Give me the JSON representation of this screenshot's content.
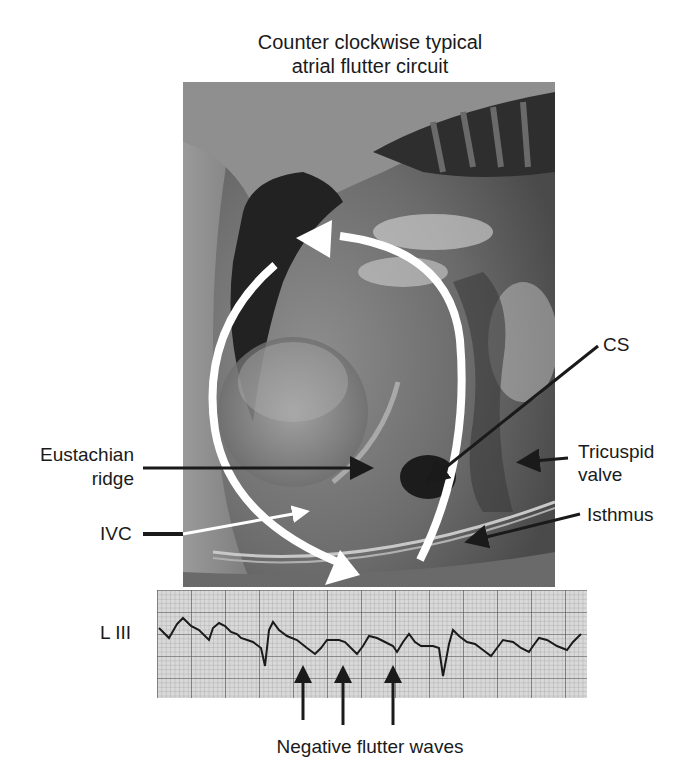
{
  "figure": {
    "title_line1": "Counter clockwise typical",
    "title_line2": "atrial flutter circuit"
  },
  "labels": {
    "cs": "CS",
    "tricuspid_line1": "Tricuspid",
    "tricuspid_line2": "valve",
    "eustachian_line1": "Eustachian",
    "eustachian_line2": "ridge",
    "ivc": "IVC",
    "isthmus": "Isthmus",
    "ecg_lead": "L III",
    "flutter_waves": "Negative flutter waves"
  },
  "colors": {
    "background": "#ffffff",
    "circuit_arrow": "#ffffff",
    "pointer_arrow": "#1a1a1a",
    "ecg_grid": "#8a8a8a",
    "ecg_trace": "#1a1a1a"
  }
}
